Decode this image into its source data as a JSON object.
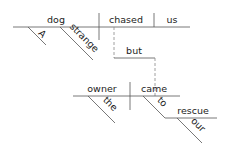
{
  "diagram": {
    "type": "sentence-diagram",
    "clause1": {
      "subject": "dog",
      "verb": "chased",
      "object": "us",
      "modifiers": [
        "A",
        "strange"
      ]
    },
    "conjunction": "but",
    "clause2": {
      "subject": "owner",
      "verb": "came",
      "subject_modifier": "the",
      "preposition": "to",
      "prep_object": "rescue",
      "prep_object_modifier": "our"
    }
  }
}
